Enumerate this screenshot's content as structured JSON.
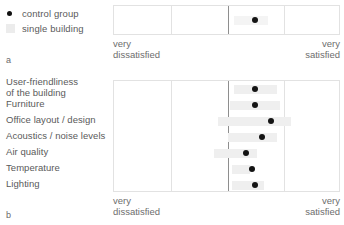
{
  "legend": {
    "items": [
      {
        "label": "control group",
        "marker": "dot-marker-icon",
        "color": "#111111"
      },
      {
        "label": "single building",
        "marker": "band-marker-icon",
        "color": "#ececec"
      }
    ]
  },
  "figure_tags": {
    "panel_a": "a",
    "panel_b": "b"
  },
  "axis": {
    "left_label": "very\ndissatisfied",
    "right_label": "very\nsatisfied"
  },
  "chart_data": {
    "type": "scatter",
    "title": "",
    "subtitle": "",
    "xlabel": "",
    "ylabel": "",
    "xlim": [
      0,
      100
    ],
    "xtick_labels": [
      "very dissatisfied",
      "very satisfied"
    ],
    "gridlines_x": [
      0,
      25,
      50,
      75,
      100
    ],
    "grid": true,
    "legend_position": "top-left",
    "panels": [
      {
        "id": "a",
        "tag": "a",
        "categories": [
          "Overall satisfaction"
        ],
        "series": [
          {
            "name": "control group",
            "type": "point",
            "values": [
              62
            ]
          },
          {
            "name": "single building",
            "type": "range",
            "ranges": [
              [
                53,
                68
              ]
            ]
          }
        ]
      },
      {
        "id": "b",
        "tag": "b",
        "categories": [
          "User-friendliness\nof the building",
          "Furniture",
          "Office layout / design",
          "Acoustics / noise levels",
          "Air quality",
          "Temperature",
          "Lighting"
        ],
        "series": [
          {
            "name": "control group",
            "type": "point",
            "values": [
              62,
              62,
              69,
              65,
              58,
              61,
              62
            ]
          },
          {
            "name": "single building",
            "type": "range",
            "ranges": [
              [
                53,
                72
              ],
              [
                51,
                73
              ],
              [
                46,
                78
              ],
              [
                50,
                72
              ],
              [
                44,
                63
              ],
              [
                52,
                60
              ],
              [
                52,
                66
              ]
            ]
          }
        ]
      }
    ]
  }
}
